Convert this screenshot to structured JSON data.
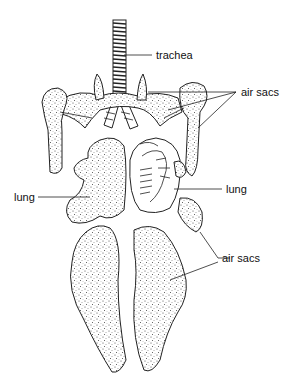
{
  "labels": {
    "trachea": "trachea",
    "air_sacs_upper": "air sacs",
    "lung_left": "lung",
    "lung_right": "lung",
    "air_sacs_lower": "air sacs"
  },
  "colors": {
    "ink": "#222222",
    "background": "#ffffff"
  }
}
